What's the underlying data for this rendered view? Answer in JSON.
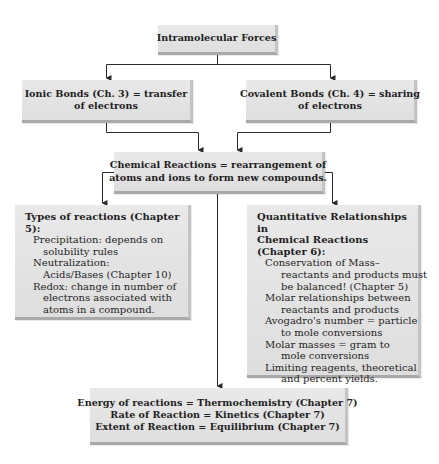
{
  "diagram": {
    "top": {
      "label": "Intramolecular Forces"
    },
    "ionic": {
      "line1": "Ionic Bonds (Ch. 3) = transfer",
      "line2": "of electrons"
    },
    "covalent": {
      "line1": "Covalent Bonds (Ch. 4) = sharing",
      "line2": "of electrons"
    },
    "reactions": {
      "line1": "Chemical Reactions = rearrangement of",
      "line2": "atoms and ions to form new compounds."
    },
    "types": {
      "title": "Types of reactions (Chapter 5):",
      "lines": [
        "Precipitation: depends on",
        "solubility rules",
        "Neutralization:",
        "Acids/Bases (Chapter 10)",
        "Redox: change in number of",
        "electrons associated with",
        "atoms in a compound."
      ]
    },
    "quantitative": {
      "title1": "Quantitative Relationships in",
      "title2": "Chemical Reactions (Chapter 6):",
      "lines": [
        "Conservation of Mass–",
        "reactants and products must",
        "be balanced! (Chapter 5)",
        "Molar relationships between",
        "reactants and products",
        "Avogadro's number = particle",
        "to mole conversions",
        "Molar masses = gram to",
        "mole conversions",
        "Limiting reagents, theoretical",
        "and percent yields."
      ]
    },
    "bottom": {
      "line1": "Energy of reactions = Thermochemistry (Chapter 7)",
      "line2": "Rate of Reaction = Kinetics (Chapter 7)",
      "line3": "Extent of Reaction = Equilibrium (Chapter 7)"
    },
    "colors": {
      "box_fill": "#e4e4e4",
      "box_shadow": "#a9a9a9",
      "line": "#2a2a2a",
      "text": "#1e1e1e"
    }
  }
}
